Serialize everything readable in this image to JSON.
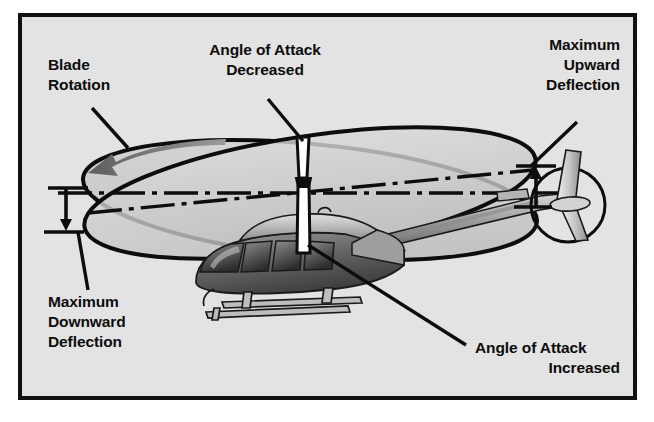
{
  "figure": {
    "kind": "technical-illustration",
    "width": 654,
    "height": 422
  },
  "frame": {
    "border_color": "#111111",
    "background_color": "#e4e4e4",
    "outer_color": "#ffffff",
    "border_width": 4,
    "x": 18,
    "y": 13,
    "w": 619,
    "h": 387
  },
  "palette": {
    "ink": "#0d0d0d",
    "disc_fill": "#c9c9c9",
    "disc_fill_light": "#d6d6d6",
    "body_dark": "#4a4a4a",
    "body_mid": "#8d8d8d",
    "body_light": "#cfcfcf",
    "mast_fill": "#ffffff",
    "arrow_gray": "#6f6f6f",
    "glass_dark": "#3c3c3c"
  },
  "labels": [
    {
      "id": "blade-rotation",
      "name": "blade-rotation-label",
      "lines": [
        "Blade",
        "Rotation"
      ],
      "align": "start",
      "x": 48,
      "y": 70,
      "line_height": 20,
      "leader": {
        "x1": 92,
        "y1": 108,
        "x2": 128,
        "y2": 148
      }
    },
    {
      "id": "angle-of-attack-decreased",
      "name": "angle-of-attack-decreased-label",
      "lines": [
        "Angle of Attack",
        "Decreased"
      ],
      "align": "middle",
      "x": 265,
      "y": 55,
      "line_height": 20,
      "leader": {
        "x1": 268,
        "y1": 99,
        "x2": 303,
        "y2": 141
      }
    },
    {
      "id": "maximum-upward-deflection",
      "name": "maximum-upward-deflection-label",
      "lines": [
        "Maximum",
        "Upward",
        "Deflection"
      ],
      "align": "end",
      "x": 620,
      "y": 50,
      "line_height": 20,
      "leader": {
        "x1": 577,
        "y1": 122,
        "x2": 531,
        "y2": 166
      }
    },
    {
      "id": "maximum-downward-deflection",
      "name": "maximum-downward-deflection-label",
      "lines": [
        "Maximum",
        "Downward",
        "Deflection"
      ],
      "align": "start",
      "x": 48,
      "y": 307,
      "line_height": 20,
      "leader": {
        "x1": 88,
        "y1": 290,
        "x2": 78,
        "y2": 232
      }
    },
    {
      "id": "angle-of-attack-increased",
      "name": "angle-of-attack-increased-label",
      "lines": [
        "Angle of Attack",
        "Increased"
      ],
      "align": "start",
      "x": 475,
      "y": 353,
      "line_height": 20,
      "leader": {
        "x1": 466,
        "y1": 345,
        "x2": 308,
        "y2": 245
      }
    }
  ],
  "annotations": {
    "rotation_arrow": {
      "name": "blade-rotation-arrow",
      "direction": "counterclockwise-left",
      "color": "#6f6f6f"
    },
    "downward_bracket": {
      "name": "maximum-downward-deflection-bracket",
      "arrow_direction": "down",
      "top_tick_y": 188,
      "bottom_tick_y": 232,
      "x": 66
    },
    "upward_bracket": {
      "name": "maximum-upward-deflection-bracket",
      "arrow_direction": "up",
      "top_tick_y": 166,
      "bottom_tick_y": 207,
      "x": 536
    }
  },
  "geometry": {
    "rotor_disc_tilted": {
      "name": "tilted-rotor-disc",
      "cx": 310,
      "cy": 193,
      "rx": 228,
      "ry": 57,
      "rotation_deg": -8.5
    },
    "reference_plane": {
      "name": "horizontal-reference-disc",
      "cx": 310,
      "cy": 200,
      "rx": 228,
      "ry": 56,
      "rotation_deg": 5.5
    },
    "centerline_axis": {
      "name": "horizontal-centerline",
      "y": 193,
      "x1": 58,
      "x2": 560,
      "pattern": "dash-dot"
    },
    "mast": {
      "name": "rotor-mast",
      "x": 296,
      "top_y": 137,
      "bottom_y": 253,
      "width": 13
    },
    "tail_rotor": {
      "name": "tail-rotor-disc",
      "cx": 568,
      "cy": 205,
      "r": 37
    }
  }
}
